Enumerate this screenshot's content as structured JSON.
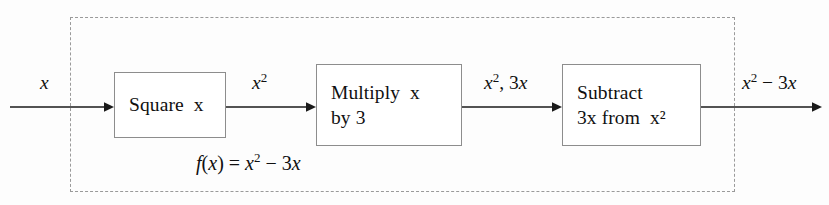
{
  "diagram": {
    "group_box": {
      "name": "function-grouping-region",
      "style": "dashed"
    },
    "colors": {
      "background": "#fdfdfd",
      "box_border": "#8d8d8d",
      "dashed_border": "#9a9a9a",
      "arrow": "#1a1a1a",
      "text": "#101010"
    },
    "boxes": [
      {
        "id": "square",
        "line1": "Square  x",
        "line2": ""
      },
      {
        "id": "multiply",
        "line1": "Multiply  x",
        "line2": "by 3"
      },
      {
        "id": "subtract",
        "line1": "Subtract",
        "line2": "3x from  x²"
      }
    ],
    "signals": {
      "input": "x",
      "after_square": "x²",
      "after_multiply": "x², 3x",
      "output": "x² − 3x"
    },
    "formula": "f(x) = x² − 3x",
    "arrow_names": {
      "input": "input-arrow",
      "square_to_multiply": "square-to-multiply-arrow",
      "multiply_to_subtract": "multiply-to-subtract-arrow",
      "output": "output-arrow"
    }
  }
}
